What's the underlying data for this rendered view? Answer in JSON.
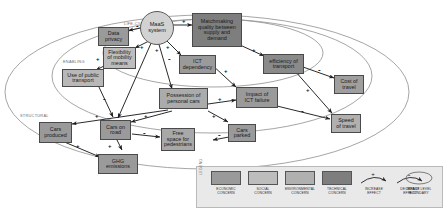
{
  "figure": {
    "background": "#ffffff"
  },
  "boundaries": [
    {
      "id": "life-cycle",
      "label": "LIFE-CYCLE"
    },
    {
      "id": "enabling",
      "label": "ENABLING"
    },
    {
      "id": "structural",
      "label": "STRUCTURAL"
    }
  ],
  "hub": {
    "id": "maas-system",
    "label": "MaaS\nsystem",
    "line1": "MaaS",
    "line2": "system",
    "category": "hub",
    "color": "#d2d2d2"
  },
  "nodes": [
    {
      "id": "data-privacy",
      "label": "Data\nprivacy",
      "category": "technical",
      "color": "#9a9a9a"
    },
    {
      "id": "matchmaking-quality",
      "label": "Matchmaking\nquality between\nsupply and\ndemand",
      "category": "technical",
      "color": "#7e7e7e"
    },
    {
      "id": "flexibility-mobility",
      "label": "Flexibility\nof mobility\nmeans",
      "category": "social",
      "color": "#bdbdbd"
    },
    {
      "id": "ict-dependency",
      "label": "ICT\ndependency",
      "category": "technical",
      "color": "#9a9a9a"
    },
    {
      "id": "efficiency-transport",
      "label": "efficiency of\ntransport",
      "category": "technical",
      "color": "#8a8a8a"
    },
    {
      "id": "use-public-transport",
      "label": "Use of public\ntransport",
      "category": "social",
      "color": "#b8b8b8"
    },
    {
      "id": "possession-cars",
      "label": "Possession of\npersonal cars",
      "category": "economic",
      "color": "#ababab"
    },
    {
      "id": "impact-ict-failure",
      "label": "Impact of\nICT failure",
      "category": "technical",
      "color": "#9a9a9a"
    },
    {
      "id": "cost-of-travel",
      "label": "Cost of\ntravel",
      "category": "economic",
      "color": "#9f9f9f"
    },
    {
      "id": "speed-of-travel",
      "label": "Speed\nof travel",
      "category": "social",
      "color": "#b0b0b0"
    },
    {
      "id": "cars-produced",
      "label": "Cars\nproduced",
      "category": "economic",
      "color": "#9a9a9a"
    },
    {
      "id": "cars-on-road",
      "label": "Cars on\nroad",
      "category": "economic",
      "color": "#9a9a9a"
    },
    {
      "id": "free-space-pedestrians",
      "label": "Free\nspace for\npedestrians",
      "category": "environmental",
      "color": "#a8a8a8"
    },
    {
      "id": "cars-parked",
      "label": "Cars\nparked",
      "category": "economic",
      "color": "#9a9a9a"
    },
    {
      "id": "ghg-emissions",
      "label": "GHG\nemissions",
      "category": "environmental",
      "color": "#9a9a9a"
    }
  ],
  "edges": [
    {
      "from": "maas-system",
      "to": "data-privacy",
      "sign": "-"
    },
    {
      "from": "maas-system",
      "to": "matchmaking-quality",
      "sign": "+"
    },
    {
      "from": "maas-system",
      "to": "flexibility-mobility",
      "sign": "+"
    },
    {
      "from": "maas-system",
      "to": "ict-dependency",
      "sign": "+"
    },
    {
      "from": "maas-system",
      "to": "possession-cars",
      "sign": "-"
    },
    {
      "from": "maas-system",
      "to": "cars-on-road",
      "sign": "+"
    },
    {
      "from": "matchmaking-quality",
      "to": "efficiency-transport",
      "sign": "+"
    },
    {
      "from": "flexibility-mobility",
      "to": "use-public-transport",
      "sign": "+"
    },
    {
      "from": "ict-dependency",
      "to": "impact-ict-failure",
      "sign": "+"
    },
    {
      "from": "efficiency-transport",
      "to": "cost-of-travel",
      "sign": "-"
    },
    {
      "from": "efficiency-transport",
      "to": "speed-of-travel",
      "sign": "+"
    },
    {
      "from": "use-public-transport",
      "to": "cars-on-road",
      "sign": "-"
    },
    {
      "from": "possession-cars",
      "to": "impact-ict-failure",
      "sign": "+"
    },
    {
      "from": "possession-cars",
      "to": "cars-on-road",
      "sign": "+"
    },
    {
      "from": "possession-cars",
      "to": "cars-parked",
      "sign": "+"
    },
    {
      "from": "possession-cars",
      "to": "cars-produced",
      "sign": "+"
    },
    {
      "from": "impact-ict-failure",
      "to": "speed-of-travel",
      "sign": "-"
    },
    {
      "from": "cars-on-road",
      "to": "free-space-pedestrians",
      "sign": "-"
    },
    {
      "from": "cars-on-road",
      "to": "ghg-emissions",
      "sign": "+"
    },
    {
      "from": "cars-parked",
      "to": "free-space-pedestrians",
      "sign": "-"
    },
    {
      "from": "cars-produced",
      "to": "ghg-emissions",
      "sign": "+"
    }
  ],
  "legend": {
    "title": "LEGEND",
    "items": [
      {
        "id": "economic-concern",
        "label": "ECONOMIC\nCONCERN",
        "type": "swatch",
        "color": "#9a9a9a"
      },
      {
        "id": "social-concern",
        "label": "SOCIAL\nCONCERN",
        "type": "swatch",
        "color": "#bdbdbd"
      },
      {
        "id": "environmental-concern",
        "label": "ENVIRONMENTAL\nCONCERN",
        "type": "swatch",
        "color": "#b0b0b0"
      },
      {
        "id": "technical-concern",
        "label": "TECHNICAL\nCONCERN",
        "type": "swatch",
        "color": "#7e7e7e"
      },
      {
        "id": "increase-effect",
        "label": "INCREASE\nEFFECT",
        "type": "arrow",
        "sign": "+"
      },
      {
        "id": "decrease-effect",
        "label": "DECREASE\nEFFECT",
        "type": "arrow",
        "sign": "-"
      },
      {
        "id": "impact-level-boundary",
        "label": "IMPACT LEVEL\nBOUNDARY",
        "type": "ellipse"
      }
    ]
  }
}
